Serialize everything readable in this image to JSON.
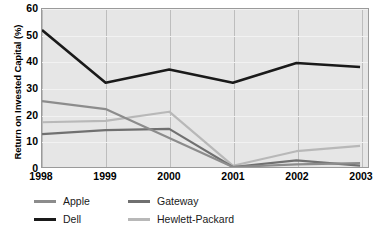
{
  "chart_data": {
    "type": "line",
    "title": "",
    "xlabel": "",
    "ylabel": "Return on Invested Capital (%)",
    "categories": [
      "1998",
      "1999",
      "2000",
      "2001",
      "2002",
      "2003"
    ],
    "x": [
      1998,
      1999,
      2000,
      2001,
      2002,
      2003
    ],
    "ylim": [
      0,
      60
    ],
    "yticks": [
      0,
      10,
      20,
      30,
      40,
      50,
      60
    ],
    "grid": true,
    "legend_position": "bottom-left",
    "series": [
      {
        "name": "Apple",
        "color": "#8c8c8c",
        "values": [
          25,
          22,
          11,
          0,
          1,
          1.5
        ]
      },
      {
        "name": "Dell",
        "color": "#1a1a1a",
        "values": [
          52,
          32,
          37,
          32,
          39.5,
          38
        ]
      },
      {
        "name": "Gateway",
        "color": "#707070",
        "values": [
          12.5,
          14,
          14.5,
          0,
          2.5,
          0.5
        ]
      },
      {
        "name": "Hewlett-Packard",
        "color": "#b8b8b8",
        "values": [
          17,
          17.5,
          21,
          0.5,
          6,
          8
        ]
      }
    ]
  },
  "axis": {
    "y_title": "Return on Invested Capital (%)",
    "y_tick_labels": [
      "0",
      "10",
      "20",
      "30",
      "40",
      "50",
      "60"
    ],
    "x_tick_labels": [
      "1998",
      "1999",
      "2000",
      "2001",
      "2002",
      "2003"
    ]
  },
  "legend": {
    "entries": [
      {
        "label": "Apple",
        "color": "#8c8c8c"
      },
      {
        "label": "Dell",
        "color": "#1a1a1a"
      },
      {
        "label": "Gateway",
        "color": "#707070"
      },
      {
        "label": "Hewlett-Packard",
        "color": "#b8b8b8"
      }
    ]
  },
  "colors": {
    "plot_background": "#e6e6e6",
    "plot_border": "#9a9a9a",
    "gridline_horizontal": "#f2f2f2",
    "gridline_vertical": "#bdbdbd",
    "page_background": "#ffffff",
    "text": "#000000"
  }
}
